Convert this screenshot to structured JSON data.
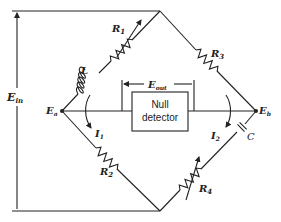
{
  "diagram": {
    "type": "bridge-circuit",
    "labels": {
      "ein": {
        "main": "E",
        "sub": "in"
      },
      "ea": {
        "main": "E",
        "sub": "a"
      },
      "eb": {
        "main": "E",
        "sub": "b"
      },
      "eout": {
        "main": "E",
        "sub": "out"
      },
      "r1": {
        "main": "R",
        "sub": "1"
      },
      "r2": {
        "main": "R",
        "sub": "2"
      },
      "r3": {
        "main": "R",
        "sub": "3"
      },
      "r4": {
        "main": "R",
        "sub": "4"
      },
      "l": {
        "main": "L"
      },
      "c": {
        "main": "C"
      },
      "i1": {
        "main": "I",
        "sub": "1"
      },
      "i2": {
        "main": "I",
        "sub": "2"
      }
    },
    "detector": {
      "line1": "Null",
      "line2": "detector"
    },
    "components": [
      {
        "id": "L",
        "kind": "inductor",
        "branch": "Ea-top"
      },
      {
        "id": "R1",
        "kind": "variable-resistor",
        "branch": "Ea-top"
      },
      {
        "id": "R3",
        "kind": "resistor",
        "branch": "top-Eb"
      },
      {
        "id": "R2",
        "kind": "resistor",
        "branch": "Ea-bottom"
      },
      {
        "id": "R4",
        "kind": "variable-resistor",
        "branch": "bottom-Eb"
      },
      {
        "id": "C",
        "kind": "capacitor",
        "branch": "bottom-Eb"
      },
      {
        "id": "NullDetector",
        "kind": "detector",
        "branch": "Ea-Eb"
      }
    ]
  }
}
